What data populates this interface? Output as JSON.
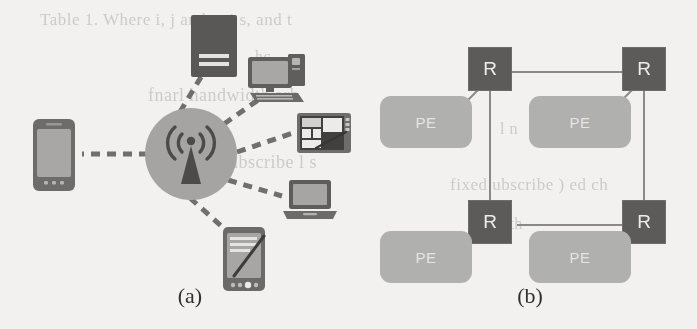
{
  "figure": {
    "panels": [
      {
        "id": "a",
        "caption": "(a)",
        "description": "wireless-access-point-topology"
      },
      {
        "id": "b",
        "caption": "(b)",
        "description": "router-pe-mesh-topology"
      }
    ]
  },
  "panel_a": {
    "caption": "(a)",
    "hub": {
      "name": "wireless-access-point",
      "icon": "wireless-antenna-icon",
      "color": "#a6a5a3"
    },
    "devices": [
      {
        "id": "smartphone",
        "icon": "smartphone-icon",
        "label": ""
      },
      {
        "id": "server-tower",
        "icon": "server-tower-icon",
        "label": ""
      },
      {
        "id": "desktop-computer",
        "icon": "desktop-computer-icon",
        "label": ""
      },
      {
        "id": "graphics-tablet",
        "icon": "graphics-tablet-icon",
        "label": ""
      },
      {
        "id": "laptop",
        "icon": "laptop-icon",
        "label": ""
      },
      {
        "id": "pda-stylus",
        "icon": "pda-stylus-icon",
        "label": ""
      }
    ],
    "link_style": "dashed",
    "link_color": "#6f6e6c"
  },
  "panel_b": {
    "caption": "(b)",
    "router_label": "R",
    "pe_label": "PE",
    "routers": [
      {
        "id": "r-top-left",
        "label": "R"
      },
      {
        "id": "r-top-right",
        "label": "R"
      },
      {
        "id": "r-bottom-left",
        "label": "R"
      },
      {
        "id": "r-bottom-right",
        "label": "R"
      }
    ],
    "pe_nodes": [
      {
        "id": "pe-top-left",
        "label": "PE"
      },
      {
        "id": "pe-top-right",
        "label": "PE"
      },
      {
        "id": "pe-bottom-left",
        "label": "PE"
      },
      {
        "id": "pe-bottom-right",
        "label": "PE"
      }
    ],
    "router_color": "#5b5a59",
    "pe_color": "#b2b1af",
    "link_color": "#8a8987"
  },
  "background_bleed": {
    "line1": "Table 1.  Where    i, j    and  o,  i       s,  and    t",
    "line2": "hc  ",
    "line3": "fnarl      handwidth     arb",
    "line4": "l  n  ",
    "line5": "l)  ubscribe  l  s",
    "line6": "fixed  ubscribe  )  ed  ch",
    "line7": "t  mgnth",
    "line8": "n  t"
  }
}
